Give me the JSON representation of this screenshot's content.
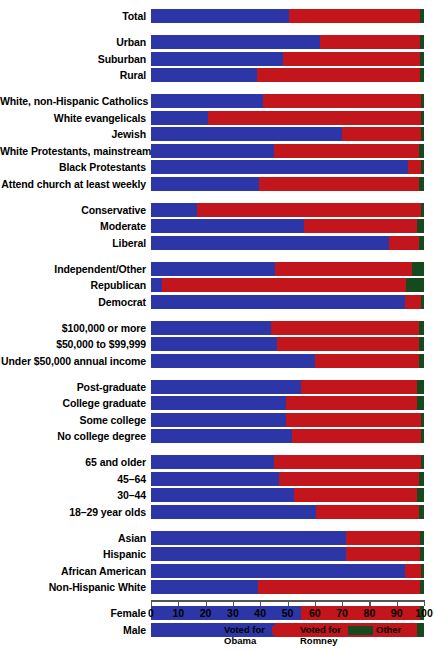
{
  "chart_data": {
    "type": "bar",
    "orientation": "horizontal",
    "stacked": true,
    "title": "",
    "xlabel": "",
    "ylabel": "",
    "xlim": [
      0,
      100
    ],
    "grid": false,
    "legend_position": "bottom",
    "axis_ticks": [
      0,
      10,
      20,
      30,
      40,
      50,
      60,
      70,
      80,
      90,
      100
    ],
    "series": [
      {
        "name": "Voted for Obama",
        "color": "#2c36a6"
      },
      {
        "name": "Voted for Romney",
        "color": "#c2151c"
      },
      {
        "name": "Other",
        "color": "#154a1e"
      }
    ],
    "groups": [
      {
        "name": "total",
        "rows": [
          {
            "label": "Total",
            "obama": 50.5,
            "romney": 48.0,
            "other": 1.5
          }
        ]
      },
      {
        "name": "community-type",
        "rows": [
          {
            "label": "Urban",
            "obama": 62.0,
            "romney": 36.5,
            "other": 1.5
          },
          {
            "label": "Suburban",
            "obama": 48.5,
            "romney": 50.0,
            "other": 1.5
          },
          {
            "label": "Rural",
            "obama": 39.0,
            "romney": 59.5,
            "other": 1.5
          }
        ]
      },
      {
        "name": "religion",
        "rows": [
          {
            "label": "White, non-Hispanic Catholics",
            "obama": 41.0,
            "romney": 58.0,
            "other": 1.0
          },
          {
            "label": "White evangelicals",
            "obama": 21.0,
            "romney": 78.0,
            "other": 1.0
          },
          {
            "label": "Jewish",
            "obama": 70.0,
            "romney": 29.0,
            "other": 1.0
          },
          {
            "label": "White Protestants, mainstream",
            "obama": 45.0,
            "romney": 53.0,
            "other": 2.0
          },
          {
            "label": "Black Protestants",
            "obama": 94.0,
            "romney": 5.0,
            "other": 1.0
          },
          {
            "label": "Attend church at least weekly",
            "obama": 39.5,
            "romney": 58.5,
            "other": 2.0
          }
        ]
      },
      {
        "name": "ideology",
        "rows": [
          {
            "label": "Conservative",
            "obama": 17.0,
            "romney": 82.0,
            "other": 1.0
          },
          {
            "label": "Moderate",
            "obama": 56.0,
            "romney": 41.5,
            "other": 2.5
          },
          {
            "label": "Liberal",
            "obama": 87.0,
            "romney": 11.0,
            "other": 2.0
          }
        ]
      },
      {
        "name": "party",
        "rows": [
          {
            "label": "Independent/Other",
            "obama": 45.5,
            "romney": 50.0,
            "other": 4.5
          },
          {
            "label": "Republican",
            "obama": 4.0,
            "romney": 89.5,
            "other": 6.5
          },
          {
            "label": "Democrat",
            "obama": 93.0,
            "romney": 6.0,
            "other": 1.0
          }
        ]
      },
      {
        "name": "income",
        "rows": [
          {
            "label": "$100,000 or more",
            "obama": 44.0,
            "romney": 54.0,
            "other": 2.0
          },
          {
            "label": "$50,000 to $99,999",
            "obama": 46.0,
            "romney": 52.0,
            "other": 2.0
          },
          {
            "label": "Under $50,000 annual income",
            "obama": 60.0,
            "romney": 38.0,
            "other": 2.0
          }
        ]
      },
      {
        "name": "education",
        "rows": [
          {
            "label": "Post-graduate",
            "obama": 55.0,
            "romney": 42.5,
            "other": 2.5
          },
          {
            "label": "College graduate",
            "obama": 49.3,
            "romney": 48.2,
            "other": 2.5
          },
          {
            "label": "Some college",
            "obama": 49.3,
            "romney": 49.7,
            "other": 1.0
          },
          {
            "label": "No college degree",
            "obama": 51.5,
            "romney": 47.5,
            "other": 1.0
          }
        ]
      },
      {
        "name": "age",
        "rows": [
          {
            "label": "65 and older",
            "obama": 45.0,
            "romney": 54.0,
            "other": 1.0
          },
          {
            "label": "45–64",
            "obama": 47.0,
            "romney": 51.0,
            "other": 2.0
          },
          {
            "label": "30–44",
            "obama": 52.4,
            "romney": 45.1,
            "other": 2.5
          },
          {
            "label": "18–29 year olds",
            "obama": 60.4,
            "romney": 37.6,
            "other": 2.0
          }
        ]
      },
      {
        "name": "race-ethnicity",
        "rows": [
          {
            "label": "Asian",
            "obama": 71.3,
            "romney": 27.2,
            "other": 1.5
          },
          {
            "label": "Hispanic",
            "obama": 71.3,
            "romney": 27.2,
            "other": 1.5
          },
          {
            "label": "African American",
            "obama": 93.0,
            "romney": 6.0,
            "other": 1.0
          },
          {
            "label": "Non-Hispanic White",
            "obama": 39.3,
            "romney": 59.2,
            "other": 1.5
          }
        ]
      },
      {
        "name": "gender",
        "rows": [
          {
            "label": "Female",
            "obama": 55.0,
            "romney": 43.5,
            "other": 1.5
          },
          {
            "label": "Male",
            "obama": 45.3,
            "romney": 52.2,
            "other": 2.5
          }
        ]
      }
    ],
    "legend": [
      {
        "label": "Voted for\nObama",
        "color": "#2c36a6"
      },
      {
        "label": "Voted for\nRomney",
        "color": "#c2151c"
      },
      {
        "label": "Other",
        "color": "#154a1e"
      }
    ]
  }
}
